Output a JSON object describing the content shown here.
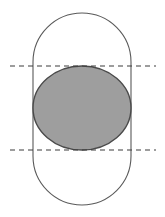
{
  "figure": {
    "canvas": {
      "width": 165,
      "height": 217,
      "background_color": "#ffffff"
    },
    "shapes": {
      "stadium": {
        "label": "stadium-outline",
        "x": 33,
        "y": 13,
        "width": 98,
        "height": 192,
        "corner_radius": 49,
        "fill": "none",
        "stroke_color": "#5a5a5a",
        "stroke_width": 1.1
      },
      "ellipse": {
        "label": "shaded-ellipse",
        "cx": 82,
        "cy": 108,
        "rx": 49,
        "ry": 42,
        "fill_color": "#9e9e9e",
        "stroke_color": "#4a4a4a",
        "stroke_width": 1.4
      },
      "dashed_line_top": {
        "label": "upper-tangent-line",
        "x1": 10,
        "y1": 66,
        "x2": 156,
        "y2": 66,
        "stroke_color": "#3c3c3c",
        "stroke_width": 1.2,
        "dash_pattern": "5,4"
      },
      "dashed_line_bottom": {
        "label": "lower-tangent-line",
        "x1": 10,
        "y1": 150,
        "x2": 156,
        "y2": 150,
        "stroke_color": "#3c3c3c",
        "stroke_width": 1.2,
        "dash_pattern": "5,4"
      }
    }
  }
}
